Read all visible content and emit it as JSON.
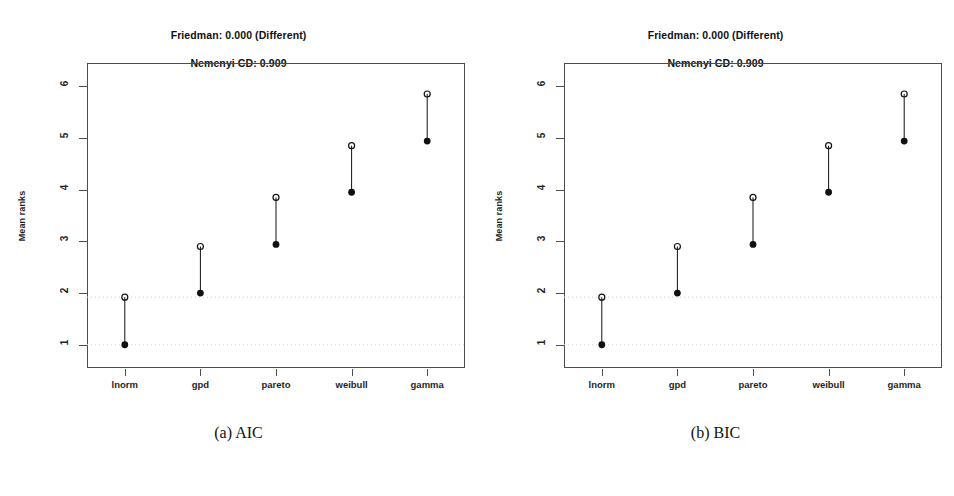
{
  "figure": {
    "background": "#ffffff",
    "axis_color": "#4d4d4d",
    "marker_color": "#111111",
    "gridline_color": "#cfcfcf"
  },
  "panels": [
    {
      "id": "aic",
      "caption": "(a) AIC",
      "title": "Friedman: 0.000 (Different)\nNemenyi CD: 0.909",
      "title_line1": "Friedman: 0.000 (Different)",
      "title_line2": "Nemenyi CD: 0.909",
      "ylabel": "Mean ranks",
      "chart_data": {
        "type": "scatter",
        "title": "Friedman: 0.000 (Different) / Nemenyi CD: 0.909",
        "xlabel": "",
        "ylabel": "Mean ranks",
        "categories": [
          "lnorm",
          "gpd",
          "pareto",
          "weibull",
          "gamma"
        ],
        "ylim": [
          0.55,
          6.45
        ],
        "yticks": [
          1,
          2,
          3,
          4,
          5,
          6
        ],
        "grid": false,
        "reference_lines": [
          1.0,
          1.92
        ],
        "series": [
          {
            "name": "mean rank",
            "marker": "filled-circle",
            "values": [
              1.0,
              2.0,
              2.94,
              3.95,
              4.94
            ]
          },
          {
            "name": "mean rank + CD",
            "marker": "open-circle",
            "values": [
              1.92,
              2.9,
              3.85,
              4.85,
              5.85
            ]
          }
        ],
        "connectors": true,
        "friedman_p": "0.000",
        "friedman_result": "Different",
        "nemenyi_cd": "0.909"
      }
    },
    {
      "id": "bic",
      "caption": "(b) BIC",
      "title": "Friedman: 0.000 (Different)\nNemenyi CD: 0.909",
      "title_line1": "Friedman: 0.000 (Different)",
      "title_line2": "Nemenyi CD: 0.909",
      "ylabel": "Mean ranks",
      "chart_data": {
        "type": "scatter",
        "title": "Friedman: 0.000 (Different) / Nemenyi CD: 0.909",
        "xlabel": "",
        "ylabel": "Mean ranks",
        "categories": [
          "lnorm",
          "gpd",
          "pareto",
          "weibull",
          "gamma"
        ],
        "ylim": [
          0.55,
          6.45
        ],
        "yticks": [
          1,
          2,
          3,
          4,
          5,
          6
        ],
        "grid": false,
        "reference_lines": [
          1.0,
          1.92
        ],
        "series": [
          {
            "name": "mean rank",
            "marker": "filled-circle",
            "values": [
              1.0,
              2.0,
              2.94,
              3.95,
              4.94
            ]
          },
          {
            "name": "mean rank + CD",
            "marker": "open-circle",
            "values": [
              1.92,
              2.9,
              3.85,
              4.85,
              5.85
            ]
          }
        ],
        "connectors": true,
        "friedman_p": "0.000",
        "friedman_result": "Different",
        "nemenyi_cd": "0.909"
      }
    }
  ]
}
